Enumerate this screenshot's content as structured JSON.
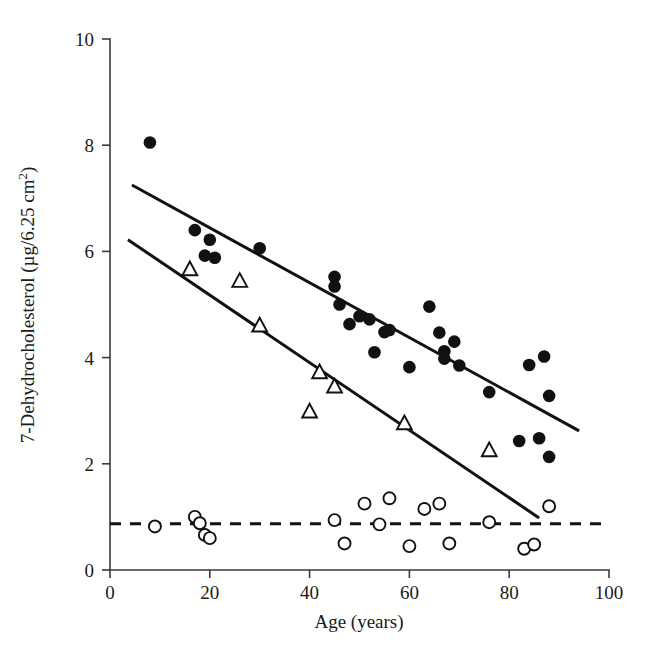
{
  "figure": {
    "background": "#ffffff",
    "ink_color": "#111111",
    "axis_color": "#3a3a3a"
  },
  "axes": {
    "x_title": "Age (years)",
    "y_title_main": "7-Dehydrocholesterol (µg/6.25 cm",
    "y_title_sup": "2",
    "y_title_close": ")",
    "x_ticklabels": [
      "0",
      "20",
      "40",
      "60",
      "80",
      "100"
    ],
    "y_ticklabels": [
      "0",
      "2",
      "4",
      "6",
      "8",
      "10"
    ]
  },
  "chart_data": {
    "type": "scatter",
    "title": "",
    "xlabel": "Age (years)",
    "ylabel": "7-Dehydrocholesterol (µg/6.25 cm2)",
    "xlim": [
      0,
      100
    ],
    "ylim": [
      0,
      10
    ],
    "xticks": [
      0,
      20,
      40,
      60,
      80,
      100
    ],
    "yticks": [
      0,
      2,
      4,
      6,
      8,
      10
    ],
    "grid": false,
    "legend": "none",
    "series": [
      {
        "name": "filled-circles",
        "marker": "filled-circle",
        "color": "#111111",
        "points": [
          [
            8,
            8.05
          ],
          [
            17,
            6.4
          ],
          [
            19,
            5.92
          ],
          [
            20,
            6.22
          ],
          [
            21,
            5.88
          ],
          [
            30,
            6.06
          ],
          [
            45,
            5.52
          ],
          [
            45,
            5.34
          ],
          [
            46,
            5.0
          ],
          [
            48,
            4.63
          ],
          [
            50,
            4.78
          ],
          [
            52,
            4.72
          ],
          [
            53,
            4.1
          ],
          [
            55,
            4.48
          ],
          [
            56,
            4.52
          ],
          [
            60,
            3.82
          ],
          [
            64,
            4.96
          ],
          [
            66,
            4.47
          ],
          [
            67,
            4.12
          ],
          [
            67,
            3.98
          ],
          [
            69,
            4.3
          ],
          [
            70,
            3.85
          ],
          [
            76,
            3.35
          ],
          [
            82,
            2.43
          ],
          [
            84,
            3.86
          ],
          [
            86,
            2.48
          ],
          [
            87,
            4.02
          ],
          [
            88,
            3.28
          ],
          [
            88,
            2.13
          ]
        ]
      },
      {
        "name": "open-triangles",
        "marker": "open-triangle",
        "color": "#111111",
        "points": [
          [
            16,
            5.66
          ],
          [
            26,
            5.44
          ],
          [
            30,
            4.6
          ],
          [
            40,
            2.98
          ],
          [
            42,
            3.72
          ],
          [
            45,
            3.45
          ],
          [
            59,
            2.76
          ],
          [
            76,
            2.25
          ]
        ]
      },
      {
        "name": "open-circles",
        "marker": "open-circle",
        "color": "#111111",
        "points": [
          [
            9,
            0.82
          ],
          [
            17,
            1.0
          ],
          [
            18,
            0.88
          ],
          [
            19,
            0.66
          ],
          [
            20,
            0.6
          ],
          [
            45,
            0.94
          ],
          [
            47,
            0.5
          ],
          [
            51,
            1.25
          ],
          [
            54,
            0.86
          ],
          [
            56,
            1.35
          ],
          [
            60,
            0.45
          ],
          [
            63,
            1.15
          ],
          [
            66,
            1.25
          ],
          [
            68,
            0.5
          ],
          [
            76,
            0.9
          ],
          [
            83,
            0.4
          ],
          [
            85,
            0.48
          ],
          [
            88,
            1.2
          ]
        ]
      }
    ],
    "fit_lines": [
      {
        "name": "upper-regression-line",
        "style": "solid",
        "x": [
          4.4,
          94.0
        ],
        "y": [
          7.25,
          2.62
        ]
      },
      {
        "name": "lower-regression-line",
        "style": "solid",
        "x": [
          3.6,
          86.0
        ],
        "y": [
          6.22,
          0.98
        ]
      }
    ],
    "reference_line": {
      "name": "baseline-dashed-line",
      "style": "dashed",
      "orientation": "horizontal",
      "y": 0.87,
      "x": [
        0,
        100
      ]
    }
  }
}
